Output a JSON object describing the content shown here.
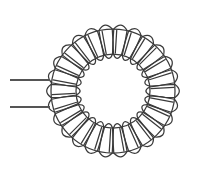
{
  "canvas": {
    "width": 203,
    "height": 178,
    "background_color": "#ffffff"
  },
  "diagram": {
    "component_type": "toroidal-coil",
    "stroke_color": "#3a3a3a",
    "stroke_width": 1.25,
    "lead_color": "#555555",
    "lead_width": 1.8
  },
  "toroid": {
    "center_x": 113,
    "center_y": 91,
    "outer_radius": 62,
    "inner_radius": 37,
    "turns": 26,
    "outer_bulge": 9,
    "inner_bulge": 8,
    "turn_half_angle_deg": 6.2,
    "start_angle_deg": 0
  },
  "leads": [
    {
      "name": "lead-top",
      "x1": 10,
      "y1": 80,
      "x2": 50,
      "y2": 80
    },
    {
      "name": "lead-bottom",
      "x1": 10,
      "y1": 107,
      "x2": 50,
      "y2": 107
    }
  ]
}
